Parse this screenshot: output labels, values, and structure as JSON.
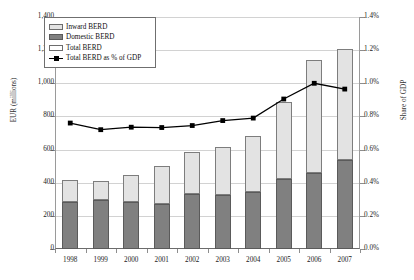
{
  "chart_data": {
    "type": "bar",
    "title": "",
    "subtitle": "",
    "categories": [
      "1998",
      "1999",
      "2000",
      "2001",
      "2002",
      "2003",
      "2004",
      "2005",
      "2006",
      "2007"
    ],
    "xlabel": "",
    "ylabel": "EUR (millions)",
    "ylim": [
      0,
      1400
    ],
    "ylabel_secondary": "Share of GDP",
    "ylim_secondary": [
      0,
      1.4
    ],
    "grid": true,
    "legend_position": "top-left",
    "yticks": [
      "0",
      "200",
      "400",
      "600",
      "800",
      "1,000",
      "1,200",
      "1,400"
    ],
    "ytick_values": [
      0,
      200,
      400,
      600,
      800,
      1000,
      1200,
      1400
    ],
    "yticks_secondary": [
      "0.0%",
      "0.2%",
      "0.4%",
      "0.6%",
      "0.8%",
      "1.0%",
      "1.2%",
      "1.4%"
    ],
    "ytick_values_secondary": [
      0.0,
      0.2,
      0.4,
      0.6,
      0.8,
      1.0,
      1.2,
      1.4
    ],
    "stacked": true,
    "series": [
      {
        "name": "Domestic BERD",
        "type": "bar",
        "axis": "left",
        "color": "#808080",
        "values": [
          285,
          295,
          285,
          270,
          330,
          328,
          343,
          423,
          460,
          535
        ]
      },
      {
        "name": "Inward BERD",
        "type": "bar",
        "axis": "left",
        "color": "#e3e3e3",
        "values": [
          130,
          113,
          162,
          232,
          255,
          285,
          340,
          467,
          680,
          670
        ]
      },
      {
        "name": "Total BERD",
        "type": "bar-total",
        "axis": "left",
        "color": "#ffffff",
        "values": [
          415,
          408,
          447,
          502,
          585,
          613,
          683,
          890,
          1140,
          1205
        ]
      },
      {
        "name": "Total BERD as % of GDP",
        "type": "line",
        "axis": "right",
        "color": "#000000",
        "values": [
          0.76,
          0.72,
          0.735,
          0.733,
          0.745,
          0.775,
          0.79,
          0.905,
          1.0,
          0.965
        ]
      }
    ]
  },
  "legend": {
    "items": [
      {
        "label": "Inward BERD",
        "swatch": "inward-swatch"
      },
      {
        "label": "Domestic BERD",
        "swatch": "domestic-swatch"
      },
      {
        "label": "Total BERD",
        "swatch": "total-swatch"
      },
      {
        "label": "Total BERD as % of GDP",
        "swatch": "line-marker-swatch"
      }
    ]
  },
  "axes": {
    "left_title": "EUR (millions)",
    "right_title": "Share of GDP"
  }
}
